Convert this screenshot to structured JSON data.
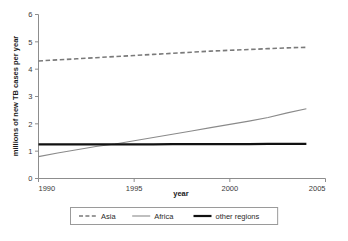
{
  "chart_data": {
    "type": "line",
    "title": "",
    "subtitle": "",
    "xlabel": "year",
    "ylabel": "millions of new TB cases per year",
    "xlim": [
      1990,
      2005
    ],
    "ylim": [
      0,
      6
    ],
    "x_ticks": [
      "1990",
      "1995",
      "2000",
      "2005"
    ],
    "x_tick_values": [
      1990,
      1995,
      2000,
      2005
    ],
    "y_ticks": [
      "0",
      "1",
      "2",
      "3",
      "4",
      "5",
      "6"
    ],
    "y_tick_values": [
      0,
      1,
      2,
      3,
      4,
      5,
      6
    ],
    "grid": false,
    "legend_position": "bottom",
    "x": [
      1990,
      1991,
      1992,
      1993,
      1994,
      1995,
      1996,
      1997,
      1998,
      1999,
      2000,
      2001,
      2002,
      2003,
      2004
    ],
    "series": [
      {
        "name": "Asia",
        "style": "dashed",
        "color": "#7a7a7a",
        "width": 1.6,
        "values": [
          4.3,
          4.34,
          4.38,
          4.42,
          4.46,
          4.5,
          4.54,
          4.58,
          4.62,
          4.66,
          4.69,
          4.72,
          4.75,
          4.78,
          4.8
        ]
      },
      {
        "name": "Africa",
        "style": "solid",
        "color": "#8a8a8a",
        "width": 1.1,
        "values": [
          0.8,
          0.93,
          1.05,
          1.17,
          1.26,
          1.38,
          1.5,
          1.62,
          1.74,
          1.86,
          1.98,
          2.1,
          2.23,
          2.4,
          2.55
        ]
      },
      {
        "name": "other regions",
        "style": "solid",
        "color": "#111111",
        "width": 2.2,
        "values": [
          1.25,
          1.25,
          1.25,
          1.25,
          1.25,
          1.25,
          1.25,
          1.26,
          1.26,
          1.26,
          1.26,
          1.26,
          1.27,
          1.27,
          1.27
        ]
      }
    ],
    "axis_color": "#8d8d8d",
    "legend": [
      {
        "label": "Asia",
        "style": "dashed",
        "color": "#7a7a7a"
      },
      {
        "label": "Africa",
        "style": "solid",
        "color": "#8a8a8a"
      },
      {
        "label": "other regions",
        "style": "solid",
        "color": "#111111"
      }
    ]
  }
}
